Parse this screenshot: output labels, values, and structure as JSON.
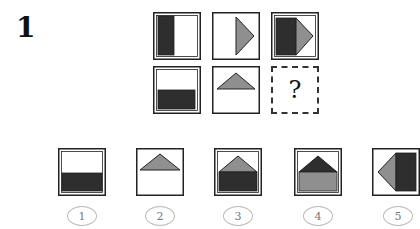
{
  "question": {
    "number": "1",
    "missing_cell_mark": "?"
  },
  "colors": {
    "dark": "#2e2e2e",
    "gray": "#8f8f8f",
    "border": "#222222",
    "dashed_border": "#333333",
    "circle_border": "#bbbbbb",
    "circle_text": "#777777"
  },
  "puzzle_grid": {
    "rows": 2,
    "cols": 3,
    "cells": [
      {
        "row": 1,
        "col": 1,
        "content": "dark rectangle on left half"
      },
      {
        "row": 1,
        "col": 2,
        "content": "gray triangle pointing right on right half"
      },
      {
        "row": 1,
        "col": 3,
        "content": "dark rectangle left + gray triangle pointing right"
      },
      {
        "row": 2,
        "col": 1,
        "content": "dark rectangle on bottom half"
      },
      {
        "row": 2,
        "col": 2,
        "content": "gray triangle pointing up on top half"
      },
      {
        "row": 2,
        "col": 3,
        "content": "missing (?)"
      }
    ]
  },
  "options": [
    {
      "label": "1",
      "content": "dark rectangle on bottom"
    },
    {
      "label": "2",
      "content": "gray triangle on top"
    },
    {
      "label": "3",
      "content": "gray triangle top + dark rectangle bottom"
    },
    {
      "label": "4",
      "content": "dark triangle top + gray rectangle bottom"
    },
    {
      "label": "5",
      "content": "gray triangle pointing left + dark rectangle right"
    }
  ]
}
